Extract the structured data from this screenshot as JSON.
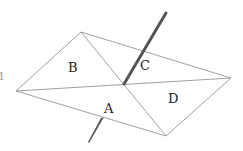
{
  "diagram": {
    "regions": [
      {
        "id": "A",
        "label": "A"
      },
      {
        "id": "B",
        "label": "B"
      },
      {
        "id": "C",
        "label": "C"
      },
      {
        "id": "D",
        "label": "D"
      }
    ],
    "vertices": {
      "top": [
        81,
        32
      ],
      "left": [
        16,
        91
      ],
      "right": [
        231,
        78
      ],
      "bottom": [
        166,
        136
      ],
      "center": [
        124,
        84
      ]
    },
    "rod": {
      "top": [
        166,
        13
      ],
      "bottom": [
        88,
        143
      ]
    },
    "colors": {
      "line": "#888888",
      "rod": "#555555",
      "text": "#222222"
    },
    "left_edge_mark": "1"
  }
}
